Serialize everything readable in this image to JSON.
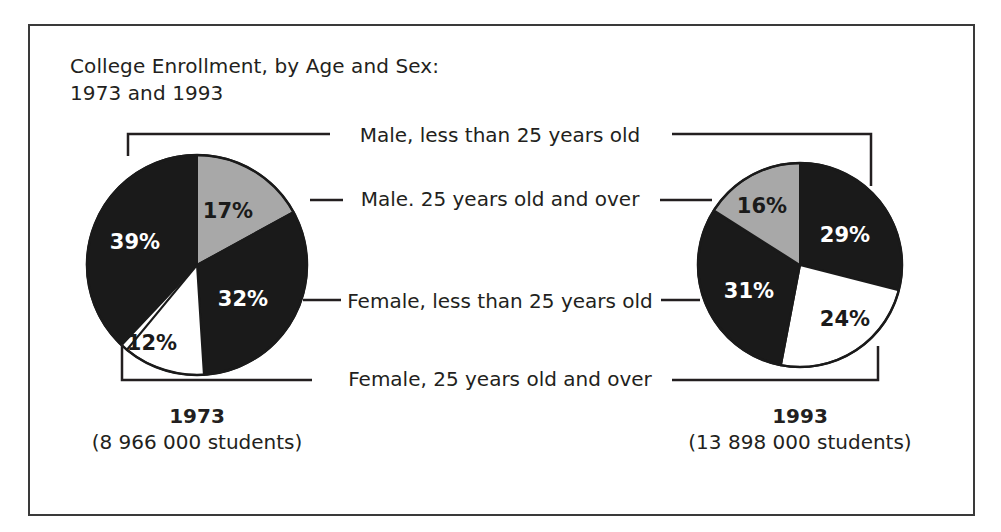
{
  "figure": {
    "title": "College Enrollment, by Age and Sex:\n1973 and 1993",
    "border_color": "#3a3a3a",
    "background": "#ffffff"
  },
  "legend": {
    "items": [
      {
        "label": "Male, less than 25 years old",
        "color": "#1a1a1a",
        "key": "male-under-25"
      },
      {
        "label": "Male. 25 years old and over",
        "color": "#a8a8a8",
        "key": "male-25-over"
      },
      {
        "label": "Female, less than 25 years old",
        "color": "#1a1a1a",
        "key": "female-under-25"
      },
      {
        "label": "Female, 25 years old and over",
        "color": "#ffffff",
        "key": "female-25-over"
      }
    ]
  },
  "colors": {
    "black": "#1a1a1a",
    "gray": "#a8a8a8",
    "white": "#ffffff",
    "outline": "#1a1a1a",
    "leader": "#231f20",
    "label_on_dark": "#ffffff",
    "label_on_light": "#1a1a1a"
  },
  "chart_data": {
    "type": "pie",
    "title": "College Enrollment, by Age and Sex: 1973 and 1993",
    "legend_position": "center",
    "categories": [
      "Male, less than 25 years old",
      "Male. 25 years old and over",
      "Female, less than 25 years old",
      "Female, 25 years old and over"
    ],
    "unit": "percent",
    "charts": [
      {
        "name": "1973",
        "year": "1973",
        "caption_year": "1973",
        "caption_count": "(8 966 000 students)",
        "total_students": 8966000,
        "center_x": 197,
        "center_y": 265,
        "radius": 110,
        "slices": [
          {
            "category": "Male, less than 25 years old",
            "value": 39,
            "label": "39%",
            "color": "#1a1a1a",
            "text_color": "#ffffff",
            "start_angle": 223.2,
            "end_angle": 363.6,
            "label_x": 135,
            "label_y": 243
          },
          {
            "category": "Male. 25 years old and over",
            "value": 17,
            "label": "17%",
            "color": "#a8a8a8",
            "text_color": "#1a1a1a",
            "start_angle": 0,
            "end_angle": 61.2,
            "label_x": 228,
            "label_y": 212
          },
          {
            "category": "Female, less than 25 years old",
            "value": 32,
            "label": "32%",
            "color": "#1a1a1a",
            "text_color": "#ffffff",
            "start_angle": 61.2,
            "end_angle": 176.4,
            "label_x": 243,
            "label_y": 300
          },
          {
            "category": "Female, 25 years old and over",
            "value": 12,
            "label": "12%",
            "color": "#ffffff",
            "text_color": "#1a1a1a",
            "start_angle": 176.4,
            "end_angle": 219.6,
            "label_x": 152,
            "label_y": 344
          }
        ]
      },
      {
        "name": "1993",
        "year": "1993",
        "caption_year": "1993",
        "caption_count": "(13 898 000 students)",
        "total_students": 13898000,
        "center_x": 800,
        "center_y": 265,
        "radius": 102,
        "slices": [
          {
            "category": "Male, less than 25 years old",
            "value": 29,
            "label": "29%",
            "color": "#1a1a1a",
            "text_color": "#ffffff",
            "start_angle": 0,
            "end_angle": 104.4,
            "label_x": 845,
            "label_y": 236
          },
          {
            "category": "Female, less than 25 years old",
            "value": 24,
            "label": "24%",
            "color": "#ffffff",
            "text_color": "#1a1a1a",
            "start_angle": 104.4,
            "end_angle": 190.8,
            "label_x": 845,
            "label_y": 320
          },
          {
            "category": "Female, 25 years old and over",
            "value": 31,
            "label": "31%",
            "color": "#1a1a1a",
            "text_color": "#ffffff",
            "start_angle": 190.8,
            "end_angle": 302.4,
            "label_x": 749,
            "label_y": 292
          },
          {
            "category": "Male. 25 years old and over",
            "value": 16,
            "label": "16%",
            "color": "#a8a8a8",
            "text_color": "#1a1a1a",
            "start_angle": 302.4,
            "end_angle": 360,
            "label_x": 762,
            "label_y": 207
          }
        ]
      }
    ]
  },
  "legend_rows": [
    {
      "key": "male-under-25",
      "label": "Male, less than 25 years old",
      "text_x": 500,
      "text_y": 124
    },
    {
      "key": "male-25-over",
      "label": "Male. 25 years old and over",
      "text_x": 500,
      "text_y": 188
    },
    {
      "key": "female-under-25",
      "label": "Female, less than 25 years old",
      "text_x": 500,
      "text_y": 290
    },
    {
      "key": "female-25-over",
      "label": "Female, 25 years old and over",
      "text_x": 500,
      "text_y": 368
    }
  ],
  "leader_lines": {
    "male_under_25": "M 128,156 L 128,134 L 330,134 M 672,134 L 871,134 L 871,186",
    "male_25_over": "M 310,200 L 343,200 M 660,200 L 712,200",
    "female_under_25": "M 303,300 L 341,300 M 661,300 L 700,300",
    "female_25_over": "M 122,344 L 122,380 L 312,380 M 672,380 L 878,380 L 878,346"
  },
  "captions": [
    {
      "year": "1973",
      "count": "(8 966 000 students)",
      "center_x": 197,
      "top": 404
    },
    {
      "year": "1993",
      "count": "(13 898 000 students)",
      "center_x": 800,
      "top": 404
    }
  ]
}
